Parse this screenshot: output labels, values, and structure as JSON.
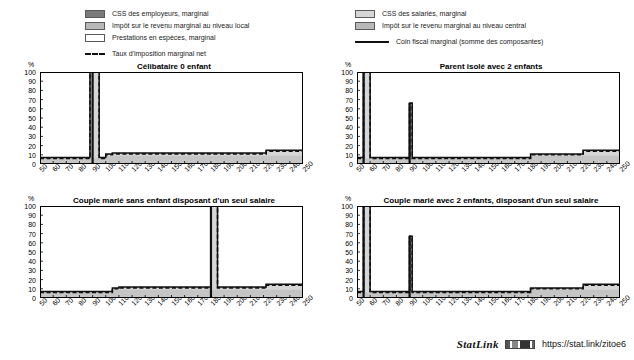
{
  "legend": {
    "left_items": [
      {
        "type": "swatch",
        "style": "dark",
        "label": "CSS des employeurs, marginal"
      },
      {
        "type": "swatch",
        "style": "mid",
        "label": "Impôt sur le revenu marginal au niveau local"
      },
      {
        "type": "swatch",
        "style": "white",
        "label": "Prestations en espèces, marginal"
      },
      {
        "type": "dashed",
        "style": "dash",
        "label": "Taux d'imposition marginal net"
      }
    ],
    "right_items": [
      {
        "type": "swatch",
        "style": "light",
        "label": "CSS des salariés, marginal"
      },
      {
        "type": "swatch",
        "style": "mid",
        "label": "Impôt sur le revenu marginal au niveau central"
      },
      {
        "type": "solid",
        "style": "solid",
        "label": "Coin fiscal marginal (somme des composantes)"
      }
    ]
  },
  "axis": {
    "y_unit": "%",
    "y_ticks": [
      0,
      10,
      20,
      30,
      40,
      50,
      60,
      70,
      80,
      90,
      100
    ],
    "y_ticks_labels": [
      "0",
      "10",
      "20",
      "30",
      "40",
      "50",
      "60",
      "70",
      "80",
      "90",
      "100"
    ],
    "x_ticks": [
      50,
      60,
      70,
      80,
      90,
      100,
      110,
      120,
      130,
      140,
      150,
      160,
      170,
      180,
      190,
      200,
      210,
      220,
      230,
      240,
      250
    ],
    "x_ticks_labels": [
      "50",
      "60",
      "70",
      "80",
      "90",
      "100",
      "110",
      "120",
      "130",
      "140",
      "150",
      "160",
      "170",
      "180",
      "190",
      "200",
      "210",
      "220",
      "230",
      "240",
      "250"
    ],
    "xlim": [
      50,
      250
    ],
    "ylim": [
      0,
      100
    ]
  },
  "colors": {
    "css_employeurs": "#7a7a7a",
    "impot_central": "#b8b8b8",
    "impot_local": "#b8b8b8",
    "css_salaries": "#d6d6d6",
    "prestations": "#ffffff",
    "line": "#111111",
    "frame": "#000000"
  },
  "footer": {
    "statlink_word": "StatLink",
    "statlink_glyph": "barcode-icon",
    "url": "https://stat.link/zitoe6"
  },
  "chart_data": [
    {
      "type": "area",
      "title": "Célibataire 0 enfant",
      "xlabel": "",
      "ylabel": "%",
      "xlim": [
        50,
        250
      ],
      "ylim": [
        0,
        100
      ],
      "grid": false,
      "x": [
        50,
        55,
        60,
        65,
        70,
        75,
        80,
        85,
        88,
        90,
        92,
        95,
        100,
        105,
        110,
        120,
        130,
        140,
        150,
        160,
        170,
        180,
        190,
        200,
        210,
        218,
        222,
        230,
        240,
        250
      ],
      "series": [
        {
          "name": "Coin fiscal marginal (somme des composantes)",
          "values": [
            7,
            7,
            7,
            7,
            7,
            7,
            7,
            7,
            100,
            100,
            100,
            7,
            11,
            12,
            12,
            12,
            12,
            12,
            12,
            12,
            12,
            12,
            12,
            12,
            12,
            12,
            15,
            15,
            15,
            15
          ]
        },
        {
          "name": "Taux d'imposition marginal net",
          "values": [
            6,
            6,
            6,
            6,
            6,
            6,
            6,
            6,
            100,
            100,
            100,
            6,
            10,
            11,
            11,
            11,
            11,
            11,
            11,
            11,
            11,
            11,
            11,
            11,
            11,
            11,
            14,
            14,
            14,
            14
          ]
        },
        {
          "name": "CSS des salariés, marginal",
          "values": [
            6,
            6,
            6,
            6,
            6,
            6,
            6,
            6,
            6,
            6,
            6,
            6,
            9,
            9,
            9,
            9,
            9,
            9,
            9,
            9,
            9,
            9,
            9,
            9,
            9,
            9,
            9,
            9,
            9,
            9
          ]
        }
      ],
      "spikes": [
        {
          "x": 90,
          "peak": 100
        }
      ],
      "plateau_note": "Coin fiscal ~7% jusqu'à 90, ~12% de 100 à 220, ~15% après 225"
    },
    {
      "type": "area",
      "title": "Parent isolé avec 2 enfants",
      "xlabel": "",
      "ylabel": "%",
      "xlim": [
        50,
        250
      ],
      "ylim": [
        0,
        100
      ],
      "grid": false,
      "x": [
        50,
        53,
        55,
        57,
        60,
        65,
        70,
        75,
        80,
        85,
        88,
        90,
        92,
        95,
        100,
        110,
        120,
        130,
        140,
        150,
        160,
        170,
        178,
        182,
        190,
        200,
        210,
        218,
        222,
        230,
        240,
        250
      ],
      "series": [
        {
          "name": "Coin fiscal marginal (somme des composantes)",
          "values": [
            7,
            7,
            100,
            100,
            7,
            7,
            7,
            7,
            7,
            7,
            7,
            66,
            7,
            7,
            7,
            7,
            7,
            7,
            7,
            7,
            7,
            7,
            7,
            11,
            11,
            11,
            11,
            11,
            15,
            15,
            15,
            15
          ]
        },
        {
          "name": "Taux d'imposition marginal net",
          "values": [
            6,
            6,
            100,
            100,
            6,
            6,
            6,
            6,
            6,
            6,
            6,
            66,
            6,
            6,
            6,
            6,
            6,
            6,
            6,
            6,
            6,
            6,
            6,
            10,
            10,
            10,
            10,
            10,
            14,
            14,
            14,
            14
          ]
        },
        {
          "name": "CSS des salariés, marginal",
          "values": [
            6,
            6,
            6,
            6,
            6,
            6,
            6,
            6,
            6,
            6,
            6,
            6,
            6,
            6,
            6,
            6,
            6,
            6,
            6,
            6,
            6,
            6,
            6,
            9,
            9,
            9,
            9,
            9,
            9,
            9,
            9,
            9
          ]
        }
      ],
      "spikes": [
        {
          "x": 55,
          "peak": 100
        },
        {
          "x": 90,
          "peak": 66
        }
      ],
      "plateau_note": "Coin fiscal ~7% jusqu'à 180, ~11% de 180 à 220, ~15% après 225"
    },
    {
      "type": "area",
      "title": "Couple marié sans enfant disposant d'un seul salaire",
      "xlabel": "",
      "ylabel": "%",
      "xlim": [
        50,
        250
      ],
      "ylim": [
        0,
        100
      ],
      "grid": false,
      "x": [
        50,
        60,
        70,
        80,
        90,
        95,
        100,
        105,
        110,
        120,
        130,
        140,
        150,
        160,
        170,
        178,
        180,
        182,
        185,
        190,
        200,
        210,
        218,
        222,
        230,
        240,
        250
      ],
      "series": [
        {
          "name": "Coin fiscal marginal (somme des composantes)",
          "values": [
            7,
            7,
            7,
            7,
            7,
            7,
            7,
            11,
            12,
            12,
            12,
            12,
            12,
            12,
            12,
            12,
            100,
            100,
            12,
            12,
            12,
            12,
            12,
            15,
            15,
            15,
            15
          ]
        },
        {
          "name": "Taux d'imposition marginal net",
          "values": [
            6,
            6,
            6,
            6,
            6,
            6,
            6,
            10,
            11,
            11,
            11,
            11,
            11,
            11,
            11,
            11,
            100,
            100,
            11,
            11,
            11,
            11,
            11,
            14,
            14,
            14,
            14
          ]
        },
        {
          "name": "CSS des salariés, marginal",
          "values": [
            6,
            6,
            6,
            6,
            6,
            6,
            6,
            9,
            9,
            9,
            9,
            9,
            9,
            9,
            9,
            9,
            9,
            9,
            9,
            9,
            9,
            9,
            9,
            9,
            9,
            9,
            9
          ]
        }
      ],
      "spikes": [
        {
          "x": 180,
          "peak": 100
        }
      ],
      "plateau_note": "Coin fiscal ~7% jusqu'à 100, ~12% de 105 à 220, ~15% après 225"
    },
    {
      "type": "area",
      "title": "Couple marié avec 2 enfants, disposant d'un seul salaire",
      "xlabel": "",
      "ylabel": "%",
      "xlim": [
        50,
        250
      ],
      "ylim": [
        0,
        100
      ],
      "grid": false,
      "x": [
        50,
        53,
        55,
        57,
        60,
        65,
        70,
        75,
        80,
        85,
        88,
        90,
        92,
        95,
        100,
        110,
        120,
        130,
        140,
        150,
        160,
        170,
        178,
        182,
        190,
        200,
        210,
        218,
        222,
        230,
        240,
        250
      ],
      "series": [
        {
          "name": "Coin fiscal marginal (somme des composantes)",
          "values": [
            7,
            7,
            100,
            100,
            7,
            7,
            7,
            7,
            7,
            7,
            7,
            67,
            7,
            7,
            7,
            7,
            7,
            7,
            7,
            7,
            7,
            7,
            7,
            11,
            11,
            11,
            11,
            11,
            15,
            15,
            15,
            15
          ]
        },
        {
          "name": "Taux d'imposition marginal net",
          "values": [
            6,
            6,
            100,
            100,
            6,
            6,
            6,
            6,
            6,
            6,
            6,
            67,
            6,
            6,
            6,
            6,
            6,
            6,
            6,
            6,
            6,
            6,
            6,
            10,
            10,
            10,
            10,
            10,
            14,
            14,
            14,
            14
          ]
        },
        {
          "name": "CSS des salariés, marginal",
          "values": [
            6,
            6,
            6,
            6,
            6,
            6,
            6,
            6,
            6,
            6,
            6,
            6,
            6,
            6,
            6,
            6,
            6,
            6,
            6,
            6,
            6,
            6,
            6,
            9,
            9,
            9,
            9,
            9,
            9,
            9,
            9,
            9
          ]
        }
      ],
      "spikes": [
        {
          "x": 55,
          "peak": 100
        },
        {
          "x": 90,
          "peak": 67
        }
      ],
      "plateau_note": "Coin fiscal ~7% jusqu'à 180, ~11% de 180 à 220, ~15% après 225"
    }
  ]
}
